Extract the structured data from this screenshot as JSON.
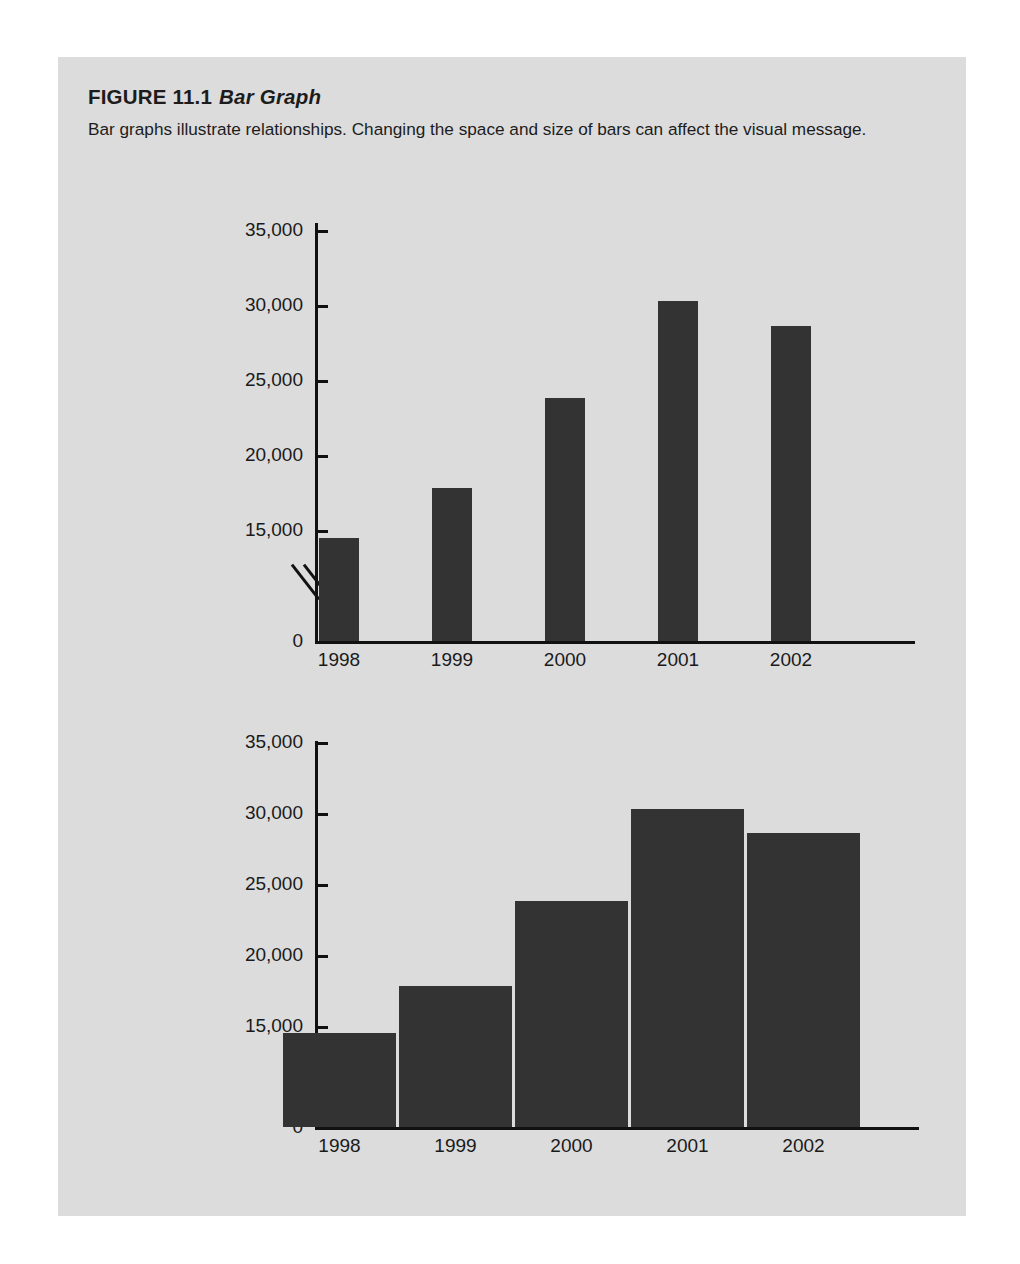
{
  "figure": {
    "label": "FIGURE 11.1",
    "title": "Bar Graph",
    "caption": "Bar graphs illustrate relationships. Changing the space and size of bars can affect the visual message."
  },
  "colors": {
    "page_background": "#ffffff",
    "panel_background": "#dcdcdc",
    "bar_fill": "#333333",
    "axis": "#111111",
    "text": "#1a1a1a"
  },
  "chart_data": [
    {
      "type": "bar",
      "name": "narrow-bars-wide-spacing",
      "title": "",
      "xlabel": "",
      "ylabel": "",
      "categories": [
        "1998",
        "1999",
        "2000",
        "2001",
        "2002"
      ],
      "values": [
        14500,
        17800,
        23800,
        30300,
        28600
      ],
      "ytick_labels": [
        "35,000",
        "30,000",
        "25,000",
        "20,000",
        "15,000",
        "0"
      ],
      "ytick_values": [
        35000,
        30000,
        25000,
        20000,
        15000,
        0
      ],
      "ylim": [
        0,
        35000
      ],
      "axis_break": true,
      "axis_break_after": 0,
      "grid": false,
      "legend": "none",
      "bar_style": "narrow bars with wide gaps"
    },
    {
      "type": "bar",
      "name": "wide-bars-no-spacing",
      "title": "",
      "xlabel": "",
      "ylabel": "",
      "categories": [
        "1998",
        "1999",
        "2000",
        "2001",
        "2002"
      ],
      "values": [
        14500,
        17800,
        23800,
        30300,
        28600
      ],
      "ytick_labels": [
        "35,000",
        "30,000",
        "25,000",
        "20,000",
        "15,000",
        "0"
      ],
      "ytick_values": [
        35000,
        30000,
        25000,
        20000,
        15000,
        0
      ],
      "ylim": [
        0,
        35000
      ],
      "axis_break": true,
      "axis_break_after": 0,
      "grid": false,
      "legend": "none",
      "bar_style": "wide adjacent bars separated by thin white lines"
    }
  ]
}
